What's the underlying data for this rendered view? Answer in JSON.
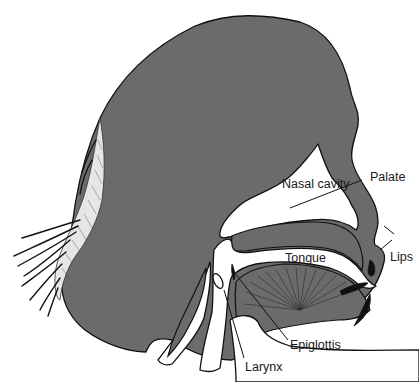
{
  "diagram": {
    "colors": {
      "tissue": "#6b6b6b",
      "outline": "#111111",
      "background": "#ffffff"
    },
    "labels": {
      "palate": "Palate",
      "nasal_cavity": "Nasal cavity",
      "tongue": "Tongue",
      "lips": "Lips",
      "epiglottis": "Epiglottis",
      "larynx": "Larynx"
    }
  }
}
